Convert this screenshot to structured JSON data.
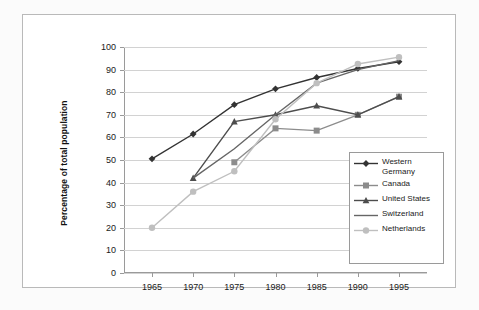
{
  "chart_data": {
    "type": "line",
    "title": "",
    "xlabel": "",
    "ylabel": "Percentage of total population",
    "x": [
      1965,
      1970,
      1975,
      1980,
      1985,
      1990,
      1995
    ],
    "xtick_labels": [
      "1965",
      "1970",
      "1975",
      "1980",
      "1985",
      "1990",
      "1995"
    ],
    "ytick_labels": [
      "0",
      "10",
      "20",
      "30",
      "40",
      "50",
      "60",
      "70",
      "80",
      "90",
      "100"
    ],
    "yticks": [
      0,
      10,
      20,
      30,
      40,
      50,
      60,
      70,
      80,
      90,
      100
    ],
    "ylim": [
      0,
      100
    ],
    "xlim": [
      1965,
      1995
    ],
    "grid": "horizontal",
    "legend_position": "inside-lower-right",
    "series": [
      {
        "name": "Western Germany",
        "legend_label": "Western\nGermany",
        "marker": "diamond",
        "color": "#333333",
        "x": [
          1965,
          1970,
          1975,
          1980,
          1985,
          1990,
          1995
        ],
        "values": [
          50.5,
          61.5,
          74.5,
          81.5,
          86.5,
          90.5,
          93.5
        ]
      },
      {
        "name": "Canada",
        "legend_label": "Canada",
        "marker": "square",
        "color": "#8c8c8c",
        "x": [
          1975,
          1980,
          1985,
          1990,
          1995
        ],
        "values": [
          49,
          64,
          63,
          70,
          78
        ]
      },
      {
        "name": "United States",
        "legend_label": "United States",
        "marker": "triangle",
        "color": "#4d4d4d",
        "x": [
          1970,
          1975,
          1980,
          1985,
          1990,
          1995
        ],
        "values": [
          42,
          67,
          70,
          74,
          70,
          78
        ]
      },
      {
        "name": "Switzerland",
        "legend_label": "Switzerland",
        "marker": "none",
        "color": "#666666",
        "x": [
          1970,
          1975,
          1980,
          1985,
          1990,
          1995
        ],
        "values": [
          42,
          55,
          70,
          84,
          90,
          94
        ]
      },
      {
        "name": "Netherlands",
        "legend_label": "Netherlands",
        "marker": "circle",
        "color": "#bfbfbf",
        "x": [
          1965,
          1970,
          1975,
          1980,
          1985,
          1990,
          1995
        ],
        "values": [
          20,
          36,
          45,
          68,
          84,
          92.5,
          95.5
        ]
      }
    ]
  }
}
